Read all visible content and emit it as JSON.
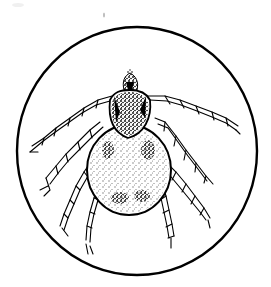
{
  "image": {
    "subject": "tick illustration",
    "description": "Black-and-white line drawing of a tick (dorsal view) with eight segmented legs, enclosed in a circle",
    "colors": {
      "background": "#ffffff",
      "ink": "#000000"
    },
    "frame": {
      "shape": "circle",
      "cx": 137,
      "cy": 151,
      "rx": 120,
      "ry": 124
    },
    "parts": {
      "capitulum": "head",
      "scutum": "shield",
      "idiosoma": "body",
      "legs": 8
    }
  }
}
